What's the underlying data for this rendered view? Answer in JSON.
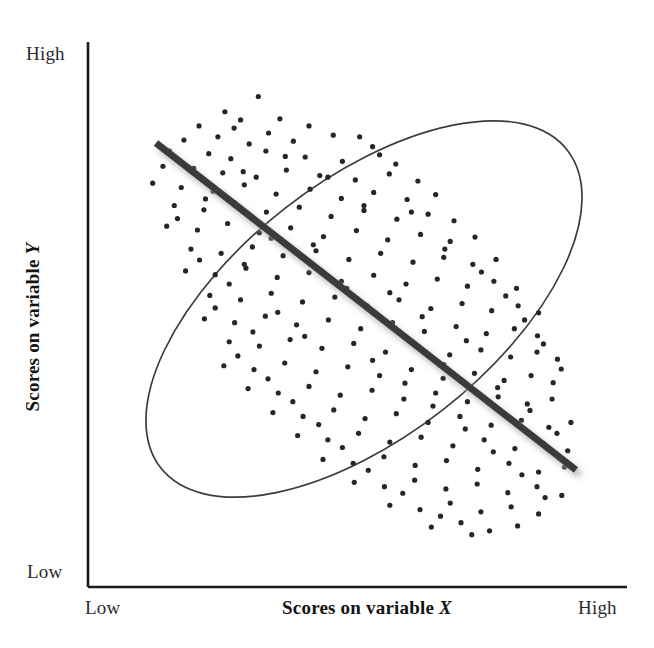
{
  "figure": {
    "kind": "scatterplot-diagram",
    "background_color": "#ffffff"
  },
  "axes": {
    "y_axis": {
      "name": "vertical-axis",
      "title": "Scores on variable Y",
      "title_variable": "Y",
      "high_label": "High",
      "low_label": "Low",
      "line_color": "#1a1a1a"
    },
    "x_axis": {
      "name": "horizontal-axis",
      "title": "Scores on variable X",
      "title_variable": "X",
      "low_label": "Low",
      "high_label": "High",
      "line_color": "#1a1a1a"
    }
  },
  "marks": {
    "ellipse": {
      "label": "data-envelope-ellipse",
      "stroke_color": "#3c3c3c",
      "fill": "none",
      "stroke_width": 1.6,
      "center_x": 364,
      "center_y": 309,
      "radius_x": 258,
      "radius_y": 128,
      "rotation_deg": -38
    },
    "trend_line": {
      "label": "negative-trend-line",
      "color": "#3a3a3a",
      "shadow_color": "#bdbdbd",
      "stroke_width": 7,
      "x1": 156,
      "y1": 143,
      "x2": 576,
      "y2": 470
    },
    "points": {
      "label": "scatter-dots",
      "color": "#262626",
      "radius": 2.6,
      "count": 230
    }
  },
  "chart_data": {
    "type": "scatter",
    "title": "",
    "xlabel": "Scores on variable X",
    "ylabel": "Scores on variable Y",
    "xlim": [
      0,
      1
    ],
    "ylim": [
      0,
      1
    ],
    "x_tick_labels": [
      "Low",
      "High"
    ],
    "y_tick_labels": [
      "Low",
      "High"
    ],
    "grid": false,
    "legend": null,
    "relationship": "negative",
    "correlation_sign": "negative",
    "trend_line": {
      "x": [
        0.13,
        0.91
      ],
      "y": [
        0.96,
        0.26
      ]
    },
    "envelope": {
      "shape": "ellipse",
      "center": [
        0.513,
        0.595
      ],
      "semi_major": 0.48,
      "semi_minor": 0.24,
      "rotation_deg": -38
    },
    "points": [
      [
        0.316,
        0.9
      ],
      [
        0.254,
        0.872
      ],
      [
        0.283,
        0.857
      ],
      [
        0.356,
        0.859
      ],
      [
        0.206,
        0.846
      ],
      [
        0.271,
        0.842
      ],
      [
        0.335,
        0.833
      ],
      [
        0.41,
        0.846
      ],
      [
        0.455,
        0.829
      ],
      [
        0.178,
        0.82
      ],
      [
        0.241,
        0.826
      ],
      [
        0.299,
        0.813
      ],
      [
        0.381,
        0.818
      ],
      [
        0.504,
        0.826
      ],
      [
        0.528,
        0.808
      ],
      [
        0.151,
        0.8
      ],
      [
        0.224,
        0.795
      ],
      [
        0.265,
        0.786
      ],
      [
        0.33,
        0.8
      ],
      [
        0.403,
        0.789
      ],
      [
        0.472,
        0.781
      ],
      [
        0.541,
        0.793
      ],
      [
        0.571,
        0.776
      ],
      [
        0.139,
        0.772
      ],
      [
        0.196,
        0.768
      ],
      [
        0.25,
        0.76
      ],
      [
        0.312,
        0.752
      ],
      [
        0.368,
        0.765
      ],
      [
        0.43,
        0.755
      ],
      [
        0.496,
        0.747
      ],
      [
        0.559,
        0.758
      ],
      [
        0.612,
        0.745
      ],
      [
        0.12,
        0.741
      ],
      [
        0.173,
        0.733
      ],
      [
        0.232,
        0.726
      ],
      [
        0.29,
        0.738
      ],
      [
        0.349,
        0.721
      ],
      [
        0.412,
        0.73
      ],
      [
        0.47,
        0.713
      ],
      [
        0.53,
        0.724
      ],
      [
        0.592,
        0.711
      ],
      [
        0.645,
        0.72
      ],
      [
        0.16,
        0.7
      ],
      [
        0.215,
        0.692
      ],
      [
        0.272,
        0.705
      ],
      [
        0.331,
        0.688
      ],
      [
        0.392,
        0.697
      ],
      [
        0.451,
        0.68
      ],
      [
        0.512,
        0.691
      ],
      [
        0.573,
        0.675
      ],
      [
        0.631,
        0.684
      ],
      [
        0.679,
        0.672
      ],
      [
        0.146,
        0.662
      ],
      [
        0.203,
        0.655
      ],
      [
        0.259,
        0.667
      ],
      [
        0.318,
        0.65
      ],
      [
        0.376,
        0.659
      ],
      [
        0.437,
        0.643
      ],
      [
        0.498,
        0.654
      ],
      [
        0.556,
        0.637
      ],
      [
        0.617,
        0.647
      ],
      [
        0.672,
        0.634
      ],
      [
        0.718,
        0.642
      ],
      [
        0.191,
        0.62
      ],
      [
        0.247,
        0.612
      ],
      [
        0.305,
        0.624
      ],
      [
        0.362,
        0.608
      ],
      [
        0.423,
        0.617
      ],
      [
        0.484,
        0.601
      ],
      [
        0.543,
        0.612
      ],
      [
        0.603,
        0.596
      ],
      [
        0.66,
        0.605
      ],
      [
        0.714,
        0.592
      ],
      [
        0.757,
        0.601
      ],
      [
        0.181,
        0.58
      ],
      [
        0.236,
        0.573
      ],
      [
        0.293,
        0.585
      ],
      [
        0.351,
        0.568
      ],
      [
        0.41,
        0.577
      ],
      [
        0.47,
        0.561
      ],
      [
        0.53,
        0.572
      ],
      [
        0.59,
        0.556
      ],
      [
        0.648,
        0.565
      ],
      [
        0.704,
        0.552
      ],
      [
        0.753,
        0.561
      ],
      [
        0.795,
        0.548
      ],
      [
        0.226,
        0.535
      ],
      [
        0.283,
        0.527
      ],
      [
        0.34,
        0.539
      ],
      [
        0.398,
        0.523
      ],
      [
        0.458,
        0.532
      ],
      [
        0.518,
        0.516
      ],
      [
        0.577,
        0.527
      ],
      [
        0.636,
        0.511
      ],
      [
        0.694,
        0.52
      ],
      [
        0.749,
        0.507
      ],
      [
        0.798,
        0.516
      ],
      [
        0.836,
        0.503
      ],
      [
        0.216,
        0.492
      ],
      [
        0.272,
        0.485
      ],
      [
        0.329,
        0.497
      ],
      [
        0.387,
        0.481
      ],
      [
        0.446,
        0.49
      ],
      [
        0.506,
        0.474
      ],
      [
        0.565,
        0.485
      ],
      [
        0.624,
        0.469
      ],
      [
        0.683,
        0.478
      ],
      [
        0.739,
        0.465
      ],
      [
        0.791,
        0.474
      ],
      [
        0.834,
        0.461
      ],
      [
        0.262,
        0.45
      ],
      [
        0.318,
        0.442
      ],
      [
        0.375,
        0.454
      ],
      [
        0.434,
        0.438
      ],
      [
        0.493,
        0.447
      ],
      [
        0.552,
        0.431
      ],
      [
        0.612,
        0.442
      ],
      [
        0.671,
        0.426
      ],
      [
        0.729,
        0.435
      ],
      [
        0.784,
        0.422
      ],
      [
        0.833,
        0.431
      ],
      [
        0.871,
        0.418
      ],
      [
        0.252,
        0.406
      ],
      [
        0.308,
        0.399
      ],
      [
        0.365,
        0.411
      ],
      [
        0.423,
        0.395
      ],
      [
        0.482,
        0.404
      ],
      [
        0.541,
        0.388
      ],
      [
        0.6,
        0.399
      ],
      [
        0.659,
        0.383
      ],
      [
        0.717,
        0.392
      ],
      [
        0.772,
        0.379
      ],
      [
        0.822,
        0.388
      ],
      [
        0.863,
        0.375
      ],
      [
        0.297,
        0.364
      ],
      [
        0.353,
        0.356
      ],
      [
        0.41,
        0.368
      ],
      [
        0.468,
        0.352
      ],
      [
        0.527,
        0.361
      ],
      [
        0.586,
        0.345
      ],
      [
        0.645,
        0.356
      ],
      [
        0.704,
        0.34
      ],
      [
        0.761,
        0.349
      ],
      [
        0.815,
        0.336
      ],
      [
        0.861,
        0.345
      ],
      [
        0.343,
        0.32
      ],
      [
        0.399,
        0.313
      ],
      [
        0.456,
        0.325
      ],
      [
        0.514,
        0.309
      ],
      [
        0.572,
        0.318
      ],
      [
        0.631,
        0.302
      ],
      [
        0.69,
        0.313
      ],
      [
        0.748,
        0.297
      ],
      [
        0.804,
        0.306
      ],
      [
        0.855,
        0.293
      ],
      [
        0.896,
        0.302
      ],
      [
        0.389,
        0.278
      ],
      [
        0.445,
        0.27
      ],
      [
        0.502,
        0.282
      ],
      [
        0.56,
        0.266
      ],
      [
        0.618,
        0.275
      ],
      [
        0.677,
        0.259
      ],
      [
        0.735,
        0.27
      ],
      [
        0.792,
        0.254
      ],
      [
        0.845,
        0.263
      ],
      [
        0.89,
        0.25
      ],
      [
        0.436,
        0.234
      ],
      [
        0.492,
        0.227
      ],
      [
        0.549,
        0.239
      ],
      [
        0.607,
        0.223
      ],
      [
        0.665,
        0.232
      ],
      [
        0.723,
        0.216
      ],
      [
        0.781,
        0.227
      ],
      [
        0.836,
        0.211
      ],
      [
        0.884,
        0.22
      ],
      [
        0.494,
        0.192
      ],
      [
        0.55,
        0.184
      ],
      [
        0.606,
        0.196
      ],
      [
        0.664,
        0.18
      ],
      [
        0.722,
        0.189
      ],
      [
        0.779,
        0.173
      ],
      [
        0.833,
        0.184
      ],
      [
        0.879,
        0.168
      ],
      [
        0.56,
        0.15
      ],
      [
        0.616,
        0.142
      ],
      [
        0.672,
        0.154
      ],
      [
        0.729,
        0.138
      ],
      [
        0.785,
        0.147
      ],
      [
        0.836,
        0.134
      ],
      [
        0.637,
        0.11
      ],
      [
        0.692,
        0.118
      ],
      [
        0.745,
        0.103
      ],
      [
        0.797,
        0.112
      ],
      [
        0.366,
        0.79
      ],
      [
        0.288,
        0.762
      ],
      [
        0.445,
        0.752
      ],
      [
        0.218,
        0.712
      ],
      [
        0.512,
        0.7
      ],
      [
        0.6,
        0.688
      ],
      [
        0.166,
        0.676
      ],
      [
        0.34,
        0.64
      ],
      [
        0.418,
        0.628
      ],
      [
        0.662,
        0.62
      ],
      [
        0.207,
        0.6
      ],
      [
        0.29,
        0.592
      ],
      [
        0.73,
        0.578
      ],
      [
        0.262,
        0.556
      ],
      [
        0.48,
        0.548
      ],
      [
        0.56,
        0.54
      ],
      [
        0.775,
        0.534
      ],
      [
        0.236,
        0.512
      ],
      [
        0.352,
        0.504
      ],
      [
        0.62,
        0.496
      ],
      [
        0.81,
        0.49
      ],
      [
        0.306,
        0.468
      ],
      [
        0.402,
        0.46
      ],
      [
        0.702,
        0.452
      ],
      [
        0.845,
        0.446
      ],
      [
        0.278,
        0.424
      ],
      [
        0.528,
        0.416
      ],
      [
        0.66,
        0.408
      ],
      [
        0.878,
        0.4
      ],
      [
        0.334,
        0.382
      ],
      [
        0.588,
        0.374
      ],
      [
        0.76,
        0.366
      ],
      [
        0.38,
        0.34
      ],
      [
        0.64,
        0.332
      ],
      [
        0.82,
        0.324
      ],
      [
        0.428,
        0.298
      ],
      [
        0.7,
        0.29
      ],
      [
        0.87,
        0.282
      ],
      [
        0.472,
        0.256
      ],
      [
        0.752,
        0.248
      ],
      [
        0.52,
        0.214
      ],
      [
        0.805,
        0.206
      ],
      [
        0.584,
        0.172
      ],
      [
        0.848,
        0.164
      ],
      [
        0.654,
        0.13
      ],
      [
        0.712,
        0.096
      ]
    ]
  }
}
